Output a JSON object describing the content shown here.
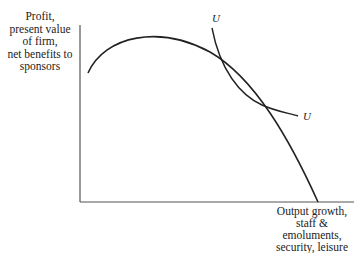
{
  "axes": {
    "y_label_lines": [
      "Profit,",
      "present value",
      "of firm,",
      "net benefits to",
      "sponsors"
    ],
    "x_label_lines": [
      "Output growth,",
      "staff &",
      "emoluments,",
      "security, leisure"
    ]
  },
  "curves": {
    "indifference_curve_label_top": "U",
    "indifference_curve_label_bottom": "U"
  },
  "colors": {
    "line": "#222222",
    "background": "#ffffff"
  }
}
